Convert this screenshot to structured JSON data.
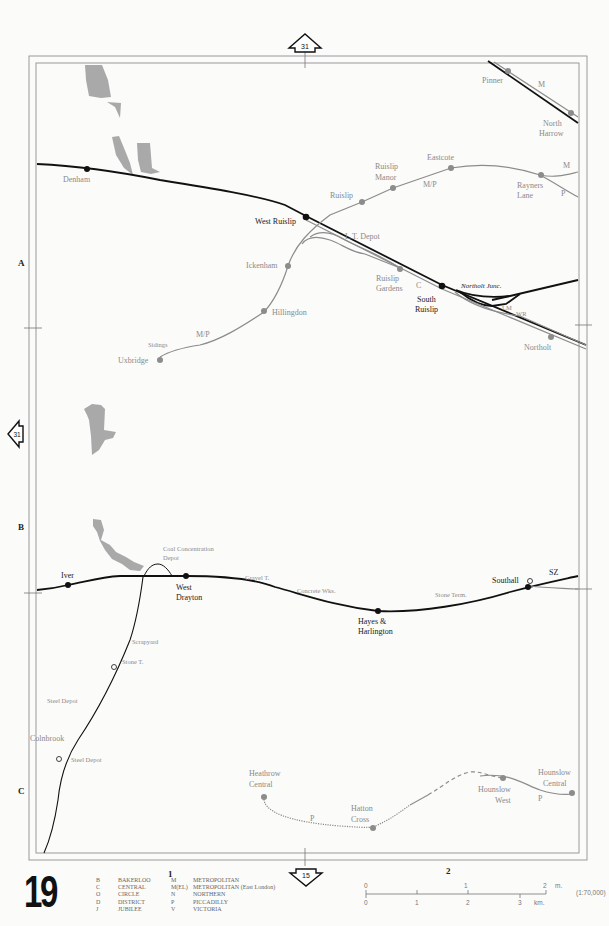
{
  "page": {
    "number": "19",
    "grid_column_labels": [
      "1",
      "2"
    ],
    "grid_row_labels": [
      "A",
      "B",
      "C"
    ]
  },
  "navigation": {
    "top_arrow_page": "31",
    "left_arrow_page": "31",
    "bottom_arrow_page": "15"
  },
  "stations": {
    "denham": "Denham",
    "west_ruislip": "West Ruislip",
    "ruislip": "Ruislip",
    "ruislip_manor_1": "Ruislip",
    "ruislip_manor_2": "Manor",
    "eastcote": "Eastcote",
    "rayners_lane_1": "Rayners",
    "rayners_lane_2": "Lane",
    "pinner": "Pinner",
    "north_harrow_1": "North",
    "north_harrow_2": "Harrow",
    "ickenham": "Ickenham",
    "hillingdon": "Hillingdon",
    "uxbridge": "Uxbridge",
    "ruislip_gardens_1": "Ruislip",
    "ruislip_gardens_2": "Gardens",
    "south_ruislip_1": "South",
    "south_ruislip_2": "Ruislip",
    "northolt": "Northolt",
    "iver": "Iver",
    "west_drayton_1": "West",
    "west_drayton_2": "Drayton",
    "hayes_1": "Hayes &",
    "hayes_2": "Harlington",
    "southall": "Southall",
    "colnbrook": "Colnbrook",
    "heathrow_1": "Heathrow",
    "heathrow_2": "Central",
    "hatton_cross_1": "Hatton",
    "hatton_cross_2": "Cross",
    "hounslow_west_1": "Hounslow",
    "hounslow_west_2": "West",
    "hounslow_central_1": "Hounslow",
    "hounslow_central_2": "Central"
  },
  "features": {
    "lt_depot": "L.T. Depot",
    "northolt_junc": "Northolt Junc.",
    "sidings": "Sidings",
    "coal_depot_1": "Coal Concentration",
    "coal_depot_2": "Depot",
    "gravel_t": "Gravel T.",
    "concrete_wks": "Concrete Wks.",
    "stone_term": "Stone Term.",
    "scrapyard": "Scrapyard",
    "stone_t": "Stone T.",
    "steel_depot_1": "Steel Depot",
    "steel_depot_2": "Steel Depot",
    "sz": "SZ"
  },
  "line_codes": {
    "m_pinner": "M",
    "m_rayners": "M",
    "p_rayners": "P",
    "mp_eastcote": "M/P",
    "mp_uxbridge": "M/P",
    "c_gardens": "C",
    "lm": "LM",
    "wr": "WR",
    "p_heathrow": "P",
    "p_hounslow": "P"
  },
  "legend": {
    "left": [
      {
        "code": "B",
        "name": "BAKERLOO"
      },
      {
        "code": "C",
        "name": "CENTRAL"
      },
      {
        "code": "O",
        "name": "CIRCLE"
      },
      {
        "code": "D",
        "name": "DISTRICT"
      },
      {
        "code": "J",
        "name": "JUBILEE"
      }
    ],
    "right": [
      {
        "code": "M",
        "name": "METROPOLITAN"
      },
      {
        "code": "M(EL)",
        "name": "METROPOLITAN (East London)"
      },
      {
        "code": "N",
        "name": "NORTHERN"
      },
      {
        "code": "P",
        "name": "PICCADILLY"
      },
      {
        "code": "V",
        "name": "VICTORIA"
      }
    ]
  },
  "scale": {
    "miles_ticks": [
      "0",
      "1",
      "2"
    ],
    "miles_unit": "m.",
    "km_ticks": [
      "0",
      "1",
      "2",
      "3"
    ],
    "km_unit": "km.",
    "ratio": "(1:70,000)"
  },
  "colors": {
    "main_line": "#111111",
    "underground_line": "#8c8c8c",
    "water": "#a9a9a9",
    "frame": "#9a9a9a"
  }
}
